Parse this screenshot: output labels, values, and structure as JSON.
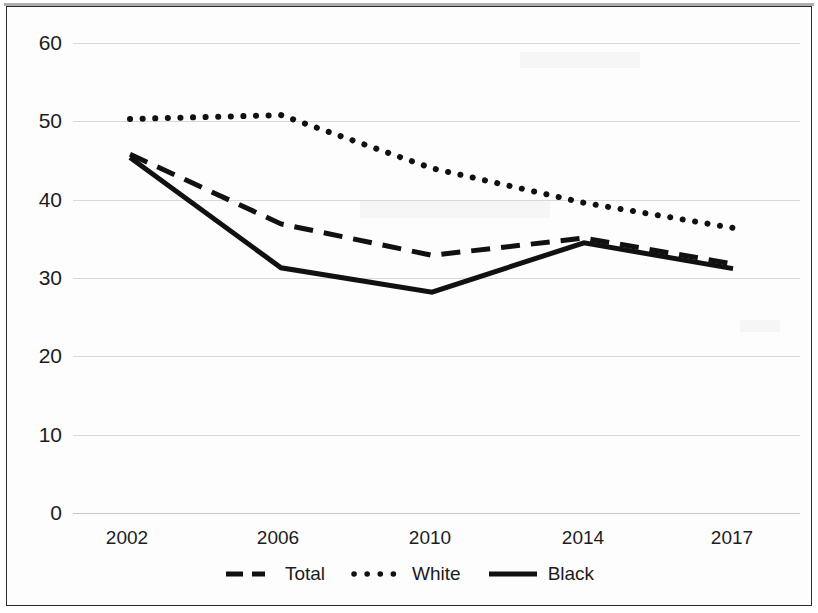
{
  "chart_data": {
    "type": "line",
    "title": "",
    "subtitle": "",
    "xlabel": "",
    "ylabel": "",
    "categories": [
      "2002",
      "2006",
      "2010",
      "2014",
      "2017"
    ],
    "x_tick_labels": [
      "2002",
      "2006",
      "2010",
      "2014",
      "2017"
    ],
    "y_tick_labels": [
      "60",
      "50",
      "40",
      "30",
      "20",
      "10",
      "0"
    ],
    "ylim": [
      0,
      60
    ],
    "y_ticks": [
      0,
      10,
      20,
      30,
      40,
      50,
      60
    ],
    "grid": "horizontal",
    "legend_position": "bottom",
    "series": [
      {
        "name": "Total",
        "style": "dashed",
        "color": "#111111",
        "values": [
          45.8,
          36.9,
          32.9,
          35.1,
          31.8
        ]
      },
      {
        "name": "White",
        "style": "dotted",
        "color": "#111111",
        "values": [
          50.3,
          50.8,
          44.0,
          39.6,
          36.4
        ]
      },
      {
        "name": "Black",
        "style": "solid",
        "color": "#111111",
        "values": [
          45.4,
          31.3,
          28.2,
          34.5,
          31.2
        ]
      }
    ]
  },
  "legend": {
    "items": [
      {
        "label": "Total",
        "style": "dashed"
      },
      {
        "label": "White",
        "style": "dotted"
      },
      {
        "label": "Black",
        "style": "solid"
      }
    ]
  },
  "axes": {
    "y_labels": [
      "60",
      "50",
      "40",
      "30",
      "20",
      "10",
      "0"
    ],
    "x_labels": [
      "2002",
      "2006",
      "2010",
      "2014",
      "2017"
    ]
  }
}
